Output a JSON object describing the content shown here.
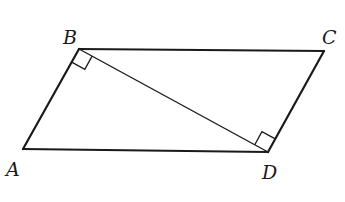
{
  "diagram": {
    "type": "geometry-figure",
    "shape": "parallelogram",
    "colors": {
      "stroke": "#1a1a1a",
      "background": "#ffffff"
    },
    "vertices": {
      "A": {
        "label": "A",
        "x": 23,
        "y": 149
      },
      "B": {
        "label": "B",
        "x": 79,
        "y": 49
      },
      "C": {
        "label": "C",
        "x": 324,
        "y": 51
      },
      "D": {
        "label": "D",
        "x": 268,
        "y": 152
      }
    },
    "labels": [
      {
        "text": "B",
        "x": 63,
        "y": 44
      },
      {
        "text": "C",
        "x": 322,
        "y": 44
      },
      {
        "text": "A",
        "x": 6,
        "y": 176
      },
      {
        "text": "D",
        "x": 262,
        "y": 179
      }
    ],
    "sides": [
      "AB",
      "BC",
      "CD",
      "DA"
    ],
    "diagonal": "BD",
    "right_angles": [
      {
        "at": "B",
        "between": [
          "BA",
          "BD"
        ]
      },
      {
        "at": "D",
        "between": [
          "DB",
          "DC"
        ]
      }
    ]
  }
}
